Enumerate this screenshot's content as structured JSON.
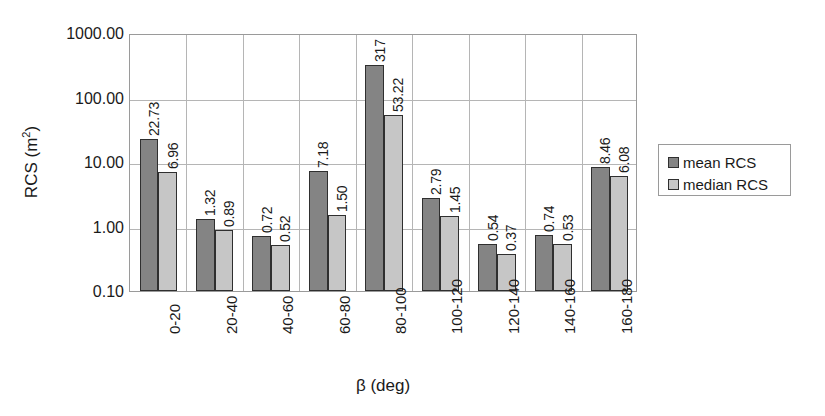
{
  "chart_data": {
    "type": "bar",
    "title": "",
    "xlabel": "β (deg)",
    "ylabel": "RCS (m²)",
    "ylabel_base": "RCS (m",
    "ylabel_sup": "2",
    "ylabel_close": ")",
    "yscale": "log",
    "ylim": [
      0.1,
      1000.0
    ],
    "yticks": [
      1000.0,
      100.0,
      10.0,
      1.0,
      0.1
    ],
    "ytick_labels": [
      "1000.00",
      "100.00",
      "10.00",
      "1.00",
      "0.10"
    ],
    "grid": "horizontal-and-vertical",
    "legend_position": "right",
    "categories": [
      "0-20",
      "20-40",
      "40-60",
      "60-80",
      "80-100",
      "100-120",
      "120-140",
      "140-160",
      "160-180"
    ],
    "series": [
      {
        "name": "mean RCS",
        "color": "#848484",
        "values": [
          22.73,
          1.32,
          0.72,
          7.18,
          317,
          2.79,
          0.54,
          0.74,
          8.46
        ],
        "labels": [
          "22.73",
          "1.32",
          "0.72",
          "7.18",
          "317",
          "2.79",
          "0.54",
          "0.74",
          "8.46"
        ]
      },
      {
        "name": "median RCS",
        "color": "#c6c6c6",
        "values": [
          6.96,
          0.89,
          0.52,
          1.5,
          53.22,
          1.45,
          0.37,
          0.53,
          6.08
        ],
        "labels": [
          "6.96",
          "0.89",
          "0.52",
          "1.50",
          "53.22",
          "1.45",
          "0.37",
          "0.53",
          "6.08"
        ]
      }
    ],
    "legend": [
      {
        "label": "mean RCS",
        "color": "#848484"
      },
      {
        "label": "median RCS",
        "color": "#c6c6c6"
      }
    ]
  }
}
